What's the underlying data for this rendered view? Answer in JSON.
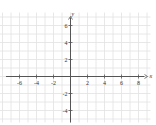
{
  "chart_data": {
    "type": "line",
    "title": "",
    "xlabel": "x",
    "ylabel": "y",
    "xlim": [
      -8,
      9
    ],
    "ylim": [
      -5,
      7
    ],
    "grid": true,
    "x_ticks": [
      -6,
      -4,
      -2,
      2,
      4,
      6,
      8
    ],
    "y_ticks": [
      6,
      4,
      2,
      -2,
      -4
    ],
    "x_tick_labels": [
      "-6",
      "-4",
      "-2",
      "2",
      "4",
      "6",
      "8"
    ],
    "y_tick_labels": [
      "6",
      "4",
      "2",
      "-2",
      "-4"
    ],
    "series": []
  },
  "colors": {
    "grid": "#e2e2e2",
    "axis": "#555555",
    "text": "#333333"
  },
  "layout": {
    "origin_x": 70,
    "origin_y": 76,
    "unit": 8.5
  }
}
